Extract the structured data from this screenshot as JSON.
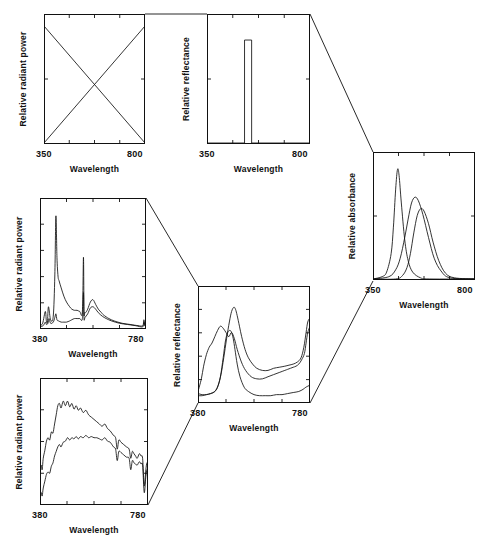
{
  "figure": {
    "background": "#ffffff",
    "ink": "#111111",
    "width": 496,
    "height": 546
  },
  "labels": {
    "wavelength": "Wavelength",
    "relative_radiant_power": "Relative radiant power",
    "relative_reflectance": "Relative reflectance",
    "relative_absorbance": "Relative absorbance",
    "t350": "350",
    "t800": "800",
    "t380": "380",
    "t780": "780"
  },
  "panels": [
    {
      "id": "illuminant-schematic",
      "name": "panel-illuminant-schematic",
      "ylabel": "Relative radiant power",
      "xlabel": "Wavelength",
      "xmin_label": "350",
      "xmax_label": "800",
      "box": {
        "x": 44,
        "y": 14,
        "w": 101,
        "h": 130
      },
      "xticks": [
        0.0,
        0.25,
        0.5,
        0.75,
        1.0
      ],
      "yticks": [
        0.0,
        0.5,
        1.0
      ]
    },
    {
      "id": "reflectance-schematic",
      "name": "panel-reflectance-schematic",
      "ylabel": "Relative reflectance",
      "xlabel": "Wavelength",
      "xmin_label": "350",
      "xmax_label": "800",
      "box": {
        "x": 207,
        "y": 14,
        "w": 103,
        "h": 130
      },
      "xticks": [
        0.0,
        0.25,
        0.5,
        0.75,
        1.0
      ],
      "yticks": [
        0.0,
        0.5,
        1.0
      ]
    },
    {
      "id": "absorbance-dyes",
      "name": "panel-absorbance-dyes",
      "ylabel": "Relative absorbance",
      "xlabel": "Wavelength",
      "xmin_label": "350",
      "xmax_label": "800",
      "box": {
        "x": 373,
        "y": 152,
        "w": 102,
        "h": 128
      },
      "xticks": [
        0.0,
        0.25,
        0.5,
        0.75,
        1.0
      ],
      "yticks": [
        0.0,
        0.5,
        1.0
      ]
    },
    {
      "id": "fluorescent-lamps",
      "name": "panel-fluorescent-lamps",
      "ylabel": "Relative radiant power",
      "xlabel": "Wavelength",
      "xmin_label": "380",
      "xmax_label": "780",
      "box": {
        "x": 40,
        "y": 198,
        "w": 106,
        "h": 131
      },
      "xticks": [
        0.0,
        0.25,
        0.5,
        0.75,
        1.0
      ],
      "yticks": [
        0.0,
        0.2,
        0.4,
        0.6,
        0.8,
        1.0
      ]
    },
    {
      "id": "daylight-sources",
      "name": "panel-daylight-sources",
      "ylabel": "Relative radiant power",
      "xlabel": "Wavelength",
      "xmin_label": "380",
      "xmax_label": "780",
      "box": {
        "x": 40,
        "y": 378,
        "w": 108,
        "h": 127
      },
      "xticks": [
        0.0,
        0.25,
        0.5,
        0.75,
        1.0
      ],
      "yticks": [
        0.0,
        0.25,
        0.5,
        0.75,
        1.0
      ]
    },
    {
      "id": "reflectance-samples",
      "name": "panel-reflectance-samples",
      "ylabel": "Relative reflectance",
      "xlabel": "Wavelength",
      "xmin_label": "380",
      "xmax_label": "780",
      "box": {
        "x": 198,
        "y": 286,
        "w": 112,
        "h": 117
      },
      "xticks": [
        0.0,
        0.25,
        0.5,
        0.75,
        1.0
      ],
      "yticks": [
        0.0,
        0.2,
        0.4,
        0.6,
        0.8,
        1.0
      ]
    }
  ],
  "connectors": [
    {
      "name": "connector-illuminant-to-reflectance",
      "points": "145,14 207,14"
    },
    {
      "name": "connector-reflectance-to-absorbance",
      "points": "310,14 373,152"
    },
    {
      "name": "connector-lamps-to-samples",
      "points": "146,198 198,286"
    },
    {
      "name": "connector-daylight-to-samples",
      "points": "148,505 198,403"
    },
    {
      "name": "connector-samples-to-absorbance",
      "points": "310,403 373,281"
    }
  ],
  "chart_data": [
    {
      "id": "illuminant-schematic",
      "type": "line",
      "title": "Idealized illuminant power distributions",
      "xlabel": "Wavelength",
      "ylabel": "Relative radiant power",
      "xlim": [
        350,
        800
      ],
      "ylim": [
        0,
        1
      ],
      "grid": false,
      "legend": "none",
      "series": [
        {
          "name": "rising-ramp",
          "x": [
            350,
            800
          ],
          "values": [
            0.0,
            1.0
          ]
        },
        {
          "name": "falling-ramp",
          "x": [
            350,
            800
          ],
          "values": [
            1.0,
            0.0
          ]
        }
      ]
    },
    {
      "id": "reflectance-schematic",
      "type": "line",
      "title": "Idealized narrow-band reflectance",
      "xlabel": "Wavelength",
      "ylabel": "Relative reflectance",
      "xlim": [
        350,
        800
      ],
      "ylim": [
        0,
        1
      ],
      "grid": false,
      "legend": "none",
      "series": [
        {
          "name": "rectangular-band",
          "x": [
            350,
            514,
            514,
            545,
            545,
            800
          ],
          "values": [
            0.0,
            0.0,
            0.88,
            0.88,
            0.0,
            0.0
          ]
        }
      ]
    },
    {
      "id": "absorbance-dyes",
      "type": "line",
      "title": "Absorbance spectra of three colorants",
      "xlabel": "Wavelength",
      "ylabel": "Relative absorbance",
      "xlim": [
        350,
        800
      ],
      "ylim": [
        0,
        1
      ],
      "grid": false,
      "legend": "none",
      "series": [
        {
          "name": "dye-1-short-wavelength",
          "x": [
            350,
            390,
            410,
            430,
            440,
            450,
            458,
            465,
            475,
            490,
            505,
            525,
            560,
            600,
            800
          ],
          "values": [
            0.0,
            0.02,
            0.06,
            0.22,
            0.45,
            0.78,
            0.95,
            0.9,
            0.66,
            0.34,
            0.16,
            0.06,
            0.01,
            0.0,
            0.0
          ]
        },
        {
          "name": "dye-2-middle-wavelength",
          "x": [
            350,
            420,
            450,
            470,
            490,
            505,
            520,
            535,
            550,
            570,
            595,
            620,
            650,
            690,
            800
          ],
          "values": [
            0.0,
            0.02,
            0.08,
            0.18,
            0.36,
            0.52,
            0.66,
            0.71,
            0.68,
            0.56,
            0.36,
            0.18,
            0.07,
            0.01,
            0.0
          ]
        },
        {
          "name": "dye-3-long-wavelength",
          "x": [
            350,
            450,
            480,
            500,
            515,
            530,
            545,
            560,
            575,
            595,
            615,
            640,
            670,
            710,
            800
          ],
          "values": [
            0.0,
            0.0,
            0.03,
            0.1,
            0.22,
            0.4,
            0.55,
            0.61,
            0.59,
            0.48,
            0.32,
            0.16,
            0.05,
            0.01,
            0.0
          ]
        }
      ]
    },
    {
      "id": "fluorescent-lamps",
      "type": "line",
      "title": "Spectral power of two fluorescent lamps",
      "xlabel": "Wavelength",
      "ylabel": "Relative radiant power",
      "xlim": [
        380,
        780
      ],
      "ylim": [
        0,
        1
      ],
      "grid": false,
      "legend": "none",
      "series": [
        {
          "name": "lamp-1-triphosphor",
          "x": [
            380,
            390,
            400,
            404,
            408,
            412,
            420,
            430,
            436,
            440,
            444,
            448,
            452,
            460,
            470,
            480,
            492,
            500,
            510,
            520,
            530,
            540,
            544,
            546,
            548,
            552,
            560,
            570,
            580,
            590,
            600,
            612,
            620,
            640,
            660,
            690,
            720,
            750,
            768,
            772,
            776,
            780
          ],
          "values": [
            0.02,
            0.04,
            0.14,
            0.06,
            0.05,
            0.18,
            0.07,
            0.1,
            0.45,
            0.95,
            0.6,
            0.44,
            0.4,
            0.34,
            0.27,
            0.22,
            0.18,
            0.16,
            0.15,
            0.15,
            0.14,
            0.14,
            0.6,
            0.14,
            0.13,
            0.13,
            0.16,
            0.22,
            0.24,
            0.2,
            0.16,
            0.13,
            0.11,
            0.08,
            0.06,
            0.04,
            0.03,
            0.02,
            0.02,
            0.07,
            0.02,
            0.01
          ]
        },
        {
          "name": "lamp-2-halophosphate",
          "x": [
            380,
            392,
            400,
            404,
            410,
            414,
            420,
            430,
            436,
            440,
            444,
            450,
            460,
            470,
            480,
            492,
            500,
            510,
            520,
            530,
            540,
            544,
            546,
            550,
            560,
            570,
            580,
            590,
            600,
            615,
            630,
            650,
            680,
            710,
            740,
            768,
            772,
            776,
            780
          ],
          "values": [
            0.01,
            0.02,
            0.05,
            0.03,
            0.04,
            0.08,
            0.04,
            0.05,
            0.09,
            0.12,
            0.07,
            0.06,
            0.05,
            0.05,
            0.05,
            0.06,
            0.07,
            0.08,
            0.08,
            0.08,
            0.08,
            0.3,
            0.08,
            0.09,
            0.12,
            0.17,
            0.18,
            0.16,
            0.13,
            0.1,
            0.08,
            0.06,
            0.04,
            0.03,
            0.02,
            0.01,
            0.05,
            0.02,
            0.01
          ]
        }
      ]
    },
    {
      "id": "daylight-sources",
      "type": "line",
      "title": "Spectral power of two daylight sources",
      "xlabel": "Wavelength",
      "ylabel": "Relative radiant power",
      "xlim": [
        380,
        780
      ],
      "ylim": [
        0,
        1
      ],
      "grid": false,
      "legend": "none",
      "series": [
        {
          "name": "daylight-1-high",
          "x": [
            380,
            384,
            388,
            392,
            398,
            404,
            410,
            416,
            422,
            428,
            434,
            440,
            446,
            452,
            458,
            466,
            474,
            482,
            490,
            498,
            506,
            514,
            522,
            530,
            540,
            550,
            560,
            570,
            580,
            590,
            600,
            610,
            620,
            630,
            640,
            652,
            660,
            666,
            672,
            680,
            690,
            700,
            710,
            716,
            722,
            728,
            734,
            740,
            748,
            754,
            760,
            766,
            772,
            776,
            780
          ],
          "values": [
            0.28,
            0.34,
            0.3,
            0.4,
            0.47,
            0.55,
            0.58,
            0.56,
            0.63,
            0.62,
            0.7,
            0.78,
            0.86,
            0.88,
            0.84,
            0.9,
            0.86,
            0.9,
            0.85,
            0.88,
            0.83,
            0.86,
            0.82,
            0.84,
            0.8,
            0.82,
            0.78,
            0.76,
            0.74,
            0.72,
            0.7,
            0.68,
            0.7,
            0.66,
            0.64,
            0.6,
            0.58,
            0.48,
            0.56,
            0.54,
            0.52,
            0.5,
            0.48,
            0.4,
            0.46,
            0.44,
            0.42,
            0.4,
            0.44,
            0.42,
            0.4,
            0.16,
            0.3,
            0.36,
            0.34
          ]
        },
        {
          "name": "daylight-2-low",
          "x": [
            380,
            384,
            388,
            392,
            398,
            404,
            410,
            416,
            422,
            428,
            434,
            440,
            446,
            452,
            458,
            466,
            474,
            482,
            490,
            498,
            506,
            514,
            522,
            530,
            540,
            550,
            560,
            570,
            580,
            590,
            600,
            610,
            620,
            630,
            640,
            652,
            660,
            666,
            672,
            680,
            690,
            700,
            710,
            716,
            722,
            728,
            734,
            740,
            748,
            754,
            760,
            766,
            772,
            776,
            780
          ],
          "values": [
            0.04,
            0.1,
            0.07,
            0.14,
            0.2,
            0.26,
            0.28,
            0.27,
            0.33,
            0.36,
            0.42,
            0.46,
            0.5,
            0.52,
            0.5,
            0.54,
            0.55,
            0.58,
            0.56,
            0.58,
            0.57,
            0.59,
            0.57,
            0.59,
            0.58,
            0.6,
            0.58,
            0.59,
            0.58,
            0.58,
            0.57,
            0.56,
            0.58,
            0.55,
            0.54,
            0.5,
            0.48,
            0.38,
            0.46,
            0.45,
            0.43,
            0.41,
            0.4,
            0.3,
            0.38,
            0.36,
            0.35,
            0.34,
            0.37,
            0.35,
            0.34,
            0.1,
            0.24,
            0.3,
            0.28
          ]
        }
      ]
    },
    {
      "id": "reflectance-samples",
      "type": "line",
      "title": "Reflectance spectra of three samples",
      "xlabel": "Wavelength",
      "ylabel": "Relative reflectance",
      "xlim": [
        380,
        780
      ],
      "ylim": [
        0,
        1
      ],
      "grid": false,
      "legend": "none",
      "series": [
        {
          "name": "sample-1-blue-green",
          "x": [
            380,
            392,
            400,
            410,
            420,
            430,
            440,
            450,
            460,
            470,
            480,
            490,
            500,
            510,
            520,
            535,
            550,
            570,
            590,
            610,
            630,
            650,
            670,
            690,
            700,
            710,
            720,
            730,
            740,
            750,
            760,
            766,
            772,
            780
          ],
          "values": [
            0.1,
            0.22,
            0.34,
            0.45,
            0.52,
            0.56,
            0.62,
            0.68,
            0.72,
            0.7,
            0.66,
            0.62,
            0.66,
            0.6,
            0.5,
            0.38,
            0.3,
            0.24,
            0.22,
            0.22,
            0.24,
            0.26,
            0.28,
            0.3,
            0.31,
            0.32,
            0.33,
            0.34,
            0.36,
            0.4,
            0.46,
            0.56,
            0.66,
            0.72
          ]
        },
        {
          "name": "sample-2-green-peak",
          "x": [
            380,
            395,
            410,
            425,
            440,
            450,
            460,
            470,
            478,
            486,
            494,
            500,
            506,
            512,
            520,
            530,
            545,
            560,
            580,
            600,
            620,
            640,
            660,
            680,
            700,
            720,
            740,
            755,
            765,
            772,
            780
          ],
          "values": [
            0.06,
            0.06,
            0.07,
            0.08,
            0.1,
            0.14,
            0.24,
            0.42,
            0.58,
            0.66,
            0.68,
            0.66,
            0.6,
            0.5,
            0.36,
            0.24,
            0.14,
            0.1,
            0.07,
            0.06,
            0.06,
            0.06,
            0.07,
            0.07,
            0.08,
            0.09,
            0.1,
            0.12,
            0.14,
            0.15,
            0.16
          ]
        },
        {
          "name": "sample-3-broad-mid",
          "x": [
            380,
            395,
            410,
            425,
            440,
            452,
            462,
            472,
            482,
            492,
            500,
            508,
            514,
            520,
            528,
            536,
            548,
            560,
            575,
            590,
            610,
            630,
            650,
            670,
            690,
            705,
            720,
            735,
            748,
            758,
            766,
            772,
            780
          ],
          "values": [
            0.08,
            0.07,
            0.07,
            0.08,
            0.1,
            0.16,
            0.26,
            0.42,
            0.6,
            0.76,
            0.86,
            0.9,
            0.88,
            0.82,
            0.72,
            0.62,
            0.5,
            0.42,
            0.36,
            0.32,
            0.3,
            0.3,
            0.32,
            0.33,
            0.34,
            0.35,
            0.36,
            0.38,
            0.42,
            0.52,
            0.66,
            0.76,
            0.8
          ]
        }
      ]
    }
  ]
}
